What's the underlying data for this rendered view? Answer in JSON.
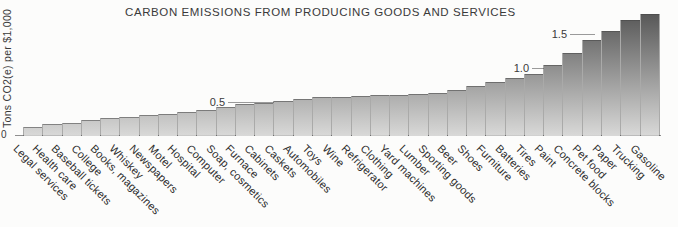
{
  "figure": {
    "background_color": "#fcfcfb"
  },
  "chart_data": {
    "type": "bar",
    "title": "CARBON EMISSIONS FROM PRODUCING GOODS AND SERVICES",
    "ylabel": "Tons CO2(e) per $1,000",
    "xlabel": "",
    "origin_tick": "0",
    "yticks": [
      {
        "label": "0.5",
        "value": 0.5
      },
      {
        "label": "1.0",
        "value": 1.0
      },
      {
        "label": "1.5",
        "value": 1.5
      }
    ],
    "ylim": [
      0,
      1.9
    ],
    "grid": false,
    "legend": false,
    "bar_gradient_top": "#4f4f4f",
    "bar_gradient_bottom": "#d9d9d8",
    "axis_color": "#8f8f8f",
    "text_color": "#3a3a3a",
    "categories": [
      "Legal services",
      "Health care",
      "Baseball tickets",
      "College",
      "Books, magazines",
      "Whiskey",
      "Newspapers",
      "Motel",
      "Hospital",
      "Computer",
      "Soap, cosmetics",
      "Furnace",
      "Cabinets",
      "Caskets",
      "Automobiles",
      "Toys",
      "Wine",
      "Refrigerator",
      "Clothing",
      "Yard machines",
      "Lumber",
      "Sporting goods",
      "Beer",
      "Shoes",
      "Furniture",
      "Batteries",
      "Tires",
      "Paint",
      "Concrete blocks",
      "Pet food",
      "Paper",
      "Trucking",
      "Gasoline"
    ],
    "values": [
      0.13,
      0.17,
      0.19,
      0.24,
      0.26,
      0.28,
      0.31,
      0.33,
      0.35,
      0.38,
      0.42,
      0.47,
      0.49,
      0.51,
      0.55,
      0.57,
      0.58,
      0.59,
      0.6,
      0.61,
      0.62,
      0.64,
      0.68,
      0.74,
      0.79,
      0.85,
      0.91,
      1.05,
      1.22,
      1.41,
      1.55,
      1.7,
      1.79
    ]
  }
}
